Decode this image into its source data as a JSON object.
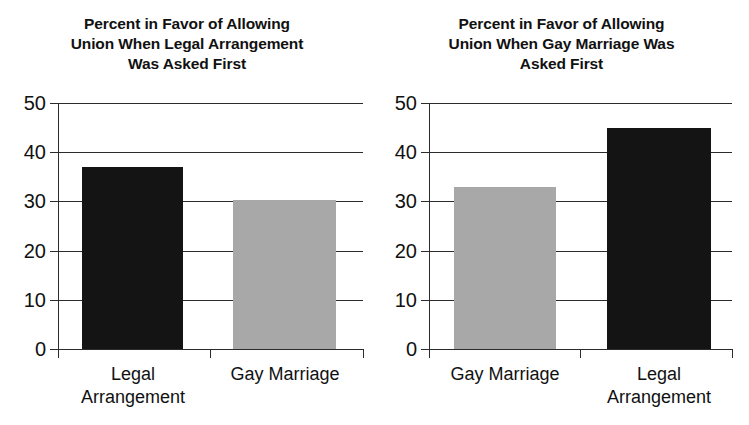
{
  "figure": {
    "background_color": "#ffffff",
    "bar_colors": {
      "dark": "#141414",
      "gray": "#a8a8a8"
    },
    "axis_color": "#2b2b2b"
  },
  "chart_data": [
    {
      "type": "bar",
      "panel": "left",
      "title": "Percent in Favor of Allowing Union When Legal Arrangement Was Asked First",
      "title_lines": [
        "Percent in Favor of Allowing",
        "Union When Legal Arrangement",
        "Was Asked First"
      ],
      "categories": [
        "Legal Arrangement",
        "Gay Marriage"
      ],
      "category_lines": [
        [
          "Legal",
          "Arrangement"
        ],
        [
          "Gay Marriage"
        ]
      ],
      "values": [
        37,
        30.3
      ],
      "bar_colors": [
        "#141414",
        "#a8a8a8"
      ],
      "xlabel": "",
      "ylabel": "",
      "ylim": [
        0,
        50
      ],
      "yticks": [
        0,
        10,
        20,
        30,
        40,
        50
      ],
      "ytick_labels": [
        "0",
        "10",
        "20",
        "30",
        "40",
        "50"
      ],
      "grid": true,
      "legend": "none"
    },
    {
      "type": "bar",
      "panel": "right",
      "title": "Percent in Favor of Allowing Union When Gay Marriage Was Asked First",
      "title_lines": [
        "Percent in Favor of Allowing",
        "Union When Gay Marriage Was",
        "Asked First"
      ],
      "categories": [
        "Gay Marriage",
        "Legal Arrangement"
      ],
      "category_lines": [
        [
          "Gay Marriage"
        ],
        [
          "Legal",
          "Arrangement"
        ]
      ],
      "values": [
        33,
        45
      ],
      "bar_colors": [
        "#a8a8a8",
        "#141414"
      ],
      "xlabel": "",
      "ylabel": "",
      "ylim": [
        0,
        50
      ],
      "yticks": [
        0,
        10,
        20,
        30,
        40,
        50
      ],
      "ytick_labels": [
        "0",
        "10",
        "20",
        "30",
        "40",
        "50"
      ],
      "grid": true,
      "legend": "none"
    }
  ]
}
